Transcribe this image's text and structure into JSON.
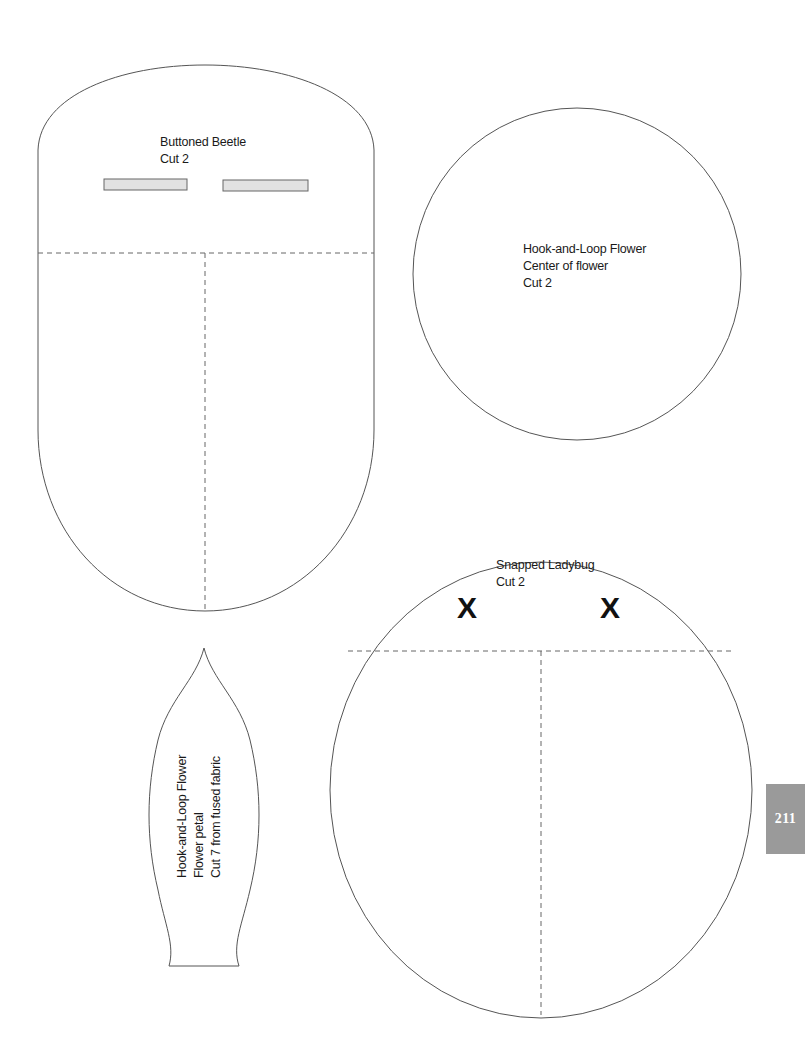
{
  "page": {
    "page_number": "211",
    "tab_color": "#9a9a9a"
  },
  "patterns": {
    "beetle": {
      "title": "Buttoned Beetle",
      "instruction": "Cut 2",
      "markings": [
        "buttonhole-left",
        "buttonhole-right"
      ]
    },
    "flower_center": {
      "title": "Hook-and-Loop Flower",
      "subtitle": "Center of flower",
      "instruction": "Cut 2"
    },
    "ladybug": {
      "title": "Snapped Ladybug",
      "instruction": "Cut 2",
      "snap_marks": [
        "X",
        "X"
      ]
    },
    "flower_petal": {
      "title": "Hook-and-Loop Flower",
      "subtitle": "Flower petal",
      "instruction": "Cut 7 from fused fabric"
    }
  },
  "colors": {
    "outline": "#555555",
    "buttonhole_fill": "#e2e2e2",
    "text": "#1a1a1a"
  }
}
